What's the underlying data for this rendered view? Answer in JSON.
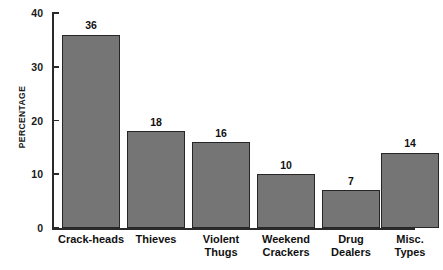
{
  "chart_data": {
    "type": "bar",
    "title": "",
    "xlabel": "",
    "ylabel": "PERCENTAGE",
    "ylim": [
      0,
      40
    ],
    "grid": false,
    "legend": "none",
    "y_ticks": [
      0,
      10,
      20,
      30,
      40
    ],
    "y_tick_labels": [
      "0",
      "10",
      "20",
      "30",
      "40"
    ],
    "categories": [
      "Crack-heads",
      "Thieves",
      "Violent Thugs",
      "Weekend Crackers",
      "Drug Dealers",
      "Misc. Types"
    ],
    "category_lines": [
      [
        "Crack-heads"
      ],
      [
        "Thieves"
      ],
      [
        "Violent",
        "Thugs"
      ],
      [
        "Weekend",
        "Crackers"
      ],
      [
        "Drug",
        "Dealers"
      ],
      [
        "Misc.",
        "Types"
      ]
    ],
    "values": [
      36,
      18,
      16,
      10,
      7,
      14
    ],
    "data_labels": [
      "36",
      "18",
      "16",
      "10",
      "7",
      "14"
    ],
    "bar_fill_color": "#757575",
    "bar_edge_color": "#262626",
    "axis_color": "#2a2a2a",
    "text_color": "#111111",
    "background_color": "#ffffff"
  }
}
